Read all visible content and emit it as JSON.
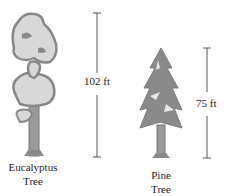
{
  "trees": [
    {
      "name_line1": "Eucalyptus",
      "name_line2": "Tree",
      "height_label": "102 ft",
      "height_ft": 102
    },
    {
      "name_line1": "Pine",
      "name_line2": "Tree",
      "height_label": "75 ft",
      "height_ft": 75
    }
  ],
  "colors": {
    "foliage": "#8a8a8a",
    "foliage_light": "#d8d8d8",
    "trunk": "#9a9a9a",
    "line": "#555555"
  }
}
